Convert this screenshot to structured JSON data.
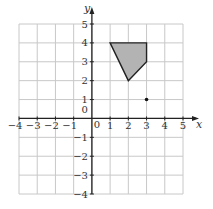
{
  "diagram": {
    "type": "coordinate-grid",
    "x_axis_label": "x",
    "y_axis_label": "y",
    "x_range": [
      -4,
      5
    ],
    "y_range": [
      -4,
      5
    ],
    "x_tick_labels": [
      "-4",
      "-3",
      "-2",
      "-1",
      "0",
      "1",
      "2",
      "3",
      "4",
      "5"
    ],
    "y_tick_labels": [
      "-4",
      "-3",
      "-2",
      "-1",
      "0",
      "1",
      "2",
      "3",
      "4",
      "5"
    ],
    "origin_label": "0",
    "shape": {
      "name": "shaded-quadrilateral",
      "vertices": [
        [
          1,
          4
        ],
        [
          3,
          4
        ],
        [
          3,
          3
        ],
        [
          2,
          2
        ]
      ],
      "fill": "#b3b3b3",
      "stroke": "#222222"
    },
    "point": {
      "name": "point",
      "coords": [
        3,
        1
      ],
      "color": "#111111"
    },
    "colors": {
      "grid": "#c8c8c8",
      "axis": "#222222"
    }
  }
}
